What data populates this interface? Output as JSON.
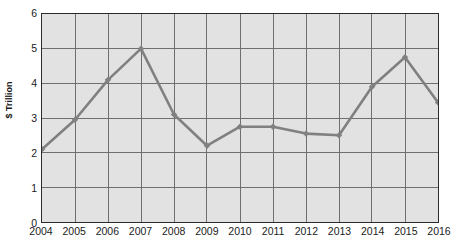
{
  "chart_data": {
    "type": "line",
    "title": "",
    "xlabel": "",
    "ylabel": "$ Trillion",
    "categories": [
      "2004",
      "2005",
      "2006",
      "2007",
      "2008",
      "2009",
      "2010",
      "2011",
      "2012",
      "2013",
      "2014",
      "2015",
      "2016"
    ],
    "values": [
      2.1,
      2.95,
      4.1,
      5.0,
      3.1,
      2.2,
      2.75,
      2.75,
      2.55,
      2.5,
      3.9,
      4.75,
      3.45
    ],
    "series": [
      {
        "name": "",
        "values": [
          2.1,
          2.95,
          4.1,
          5.0,
          3.1,
          2.2,
          2.75,
          2.75,
          2.55,
          2.5,
          3.9,
          4.75,
          3.45
        ]
      }
    ],
    "ylim": [
      0,
      6
    ],
    "yticks": [
      0,
      1,
      2,
      3,
      4,
      5,
      6
    ],
    "ytick_labels": [
      "0",
      "1",
      "2",
      "3",
      "4",
      "5",
      "6"
    ],
    "grid": true,
    "legend": false,
    "legend_position": "none",
    "line_color": "#808080",
    "marker": "diamond",
    "plot_background": "#e2e2e2",
    "grid_color": "#6e6e6e",
    "frame_color": "#2b2b2b"
  },
  "axes": {
    "y_title": "$ Trillion",
    "y_labels": [
      "6",
      "5",
      "4",
      "3",
      "2",
      "1",
      "0"
    ],
    "x_labels": [
      "2004",
      "2005",
      "2006",
      "2007",
      "2008",
      "2009",
      "2010",
      "2011",
      "2012",
      "2013",
      "2014",
      "2015",
      "2016"
    ]
  }
}
